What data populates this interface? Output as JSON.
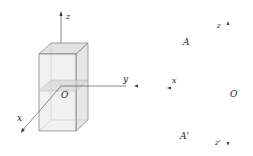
{
  "left_figure": {
    "axes": {
      "z": "z",
      "y": "y",
      "x": "x"
    },
    "origin": "O"
  },
  "right_figure": {
    "labels": {
      "z": "z",
      "z_prime": "z'",
      "A": "A",
      "A_prime": "A'",
      "x": "x",
      "O": "O"
    }
  },
  "colors": {
    "line": "#555555",
    "box_fill": "#eeeeee",
    "box_top": "#e2e2e2",
    "plane": "#d6d6d6"
  }
}
